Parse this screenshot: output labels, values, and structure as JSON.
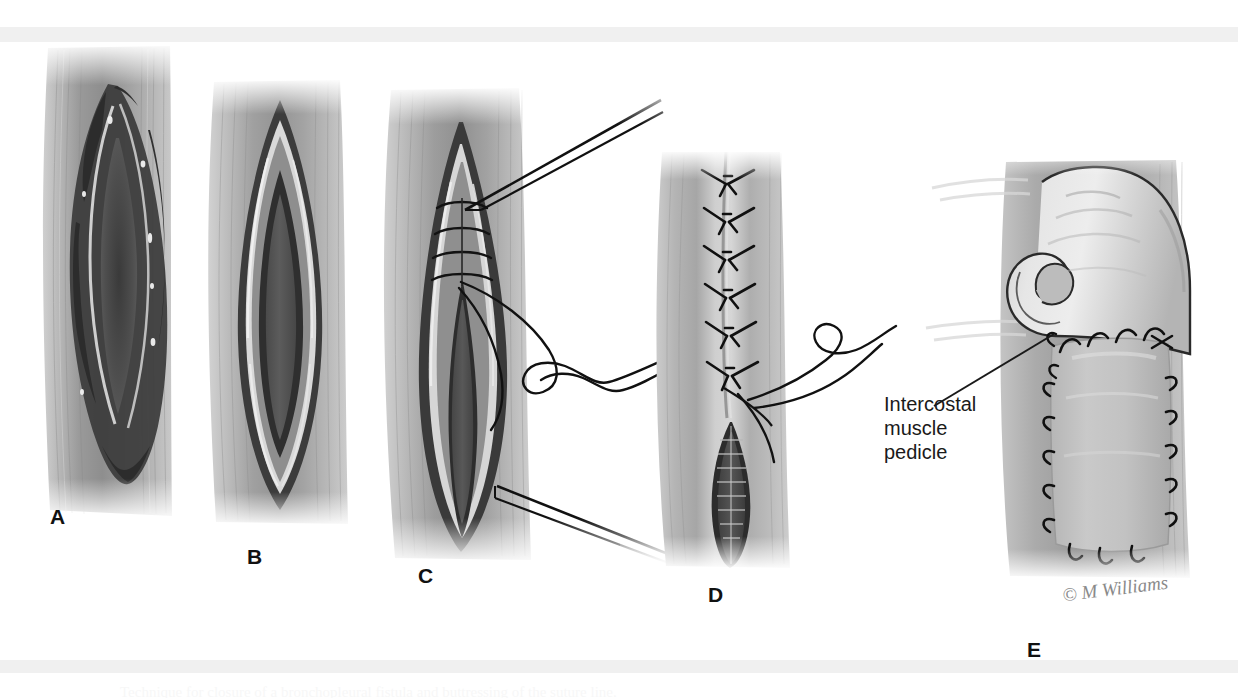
{
  "figure": {
    "background_color": "#ffffff",
    "band_color": "#f0f0f0",
    "caption_text": "Technique for closure of a bronchopleural fistula and buttressing of the suture line."
  },
  "panels": [
    {
      "letter": "A",
      "name": "panel-a-necrotic-wound",
      "description": "Open chest wall wound with ragged necrotic edges before debridement"
    },
    {
      "letter": "B",
      "name": "panel-b-debrided-wound",
      "description": "Wound after debridement showing clean elliptical layered edges"
    },
    {
      "letter": "C",
      "name": "panel-c-suture-placement",
      "description": "Interrupted sutures placed at the superior apex with needle and thread"
    },
    {
      "letter": "D",
      "name": "panel-d-partial-closure",
      "description": "Upper wound closed with interrupted sutures, residual inferior defect remains"
    },
    {
      "letter": "E",
      "name": "panel-e-muscle-pedicle-flap",
      "description": "Intercostal muscle pedicle flap rotated and sutured over the residual defect"
    }
  ],
  "annotations": {
    "intercostal_label": "Intercostal\nmuscle\npedicle"
  },
  "credit": {
    "signature": "© M Williams"
  }
}
